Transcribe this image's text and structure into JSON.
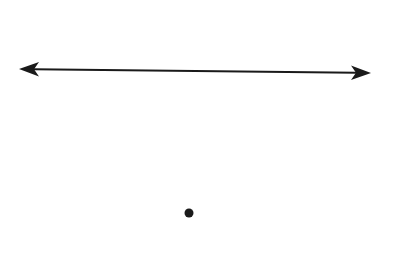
{
  "figure": {
    "background": "#ffffff",
    "stroke_color": "#1a1a1a",
    "line": {
      "label": "",
      "start": [
        20,
        69
      ],
      "end": [
        370,
        73
      ],
      "arrow_both_ends": true
    },
    "point": {
      "label": "",
      "center": [
        189,
        213
      ],
      "radius": 4.5
    }
  }
}
